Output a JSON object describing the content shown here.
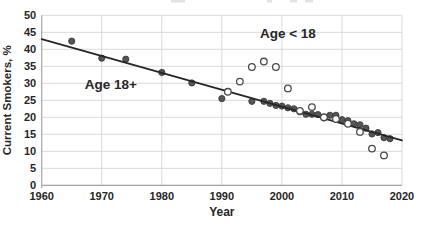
{
  "chart_data": {
    "type": "scatter",
    "title": "",
    "xlabel": "Year",
    "ylabel": "Current Smokers, %",
    "xlim": [
      1960,
      2020
    ],
    "ylim": [
      0,
      50
    ],
    "x_ticks": [
      1960,
      1970,
      1980,
      1990,
      2000,
      2010,
      2020
    ],
    "y_ticks": [
      0,
      5,
      10,
      15,
      20,
      25,
      30,
      35,
      40,
      45,
      50
    ],
    "grid": true,
    "legend_position": "none",
    "series": [
      {
        "name": "Age 18+",
        "marker": "filled-circle",
        "fill": "#555555",
        "stroke": "#3b3b3b",
        "points": [
          [
            1965,
            42.4
          ],
          [
            1970,
            37.4
          ],
          [
            1974,
            37.1
          ],
          [
            1980,
            33.2
          ],
          [
            1985,
            30.1
          ],
          [
            1990,
            25.5
          ],
          [
            1995,
            24.7
          ],
          [
            1997,
            24.7
          ],
          [
            1998,
            24.1
          ],
          [
            1999,
            23.5
          ],
          [
            2000,
            23.3
          ],
          [
            2001,
            22.8
          ],
          [
            2002,
            22.5
          ],
          [
            2003,
            21.6
          ],
          [
            2004,
            20.9
          ],
          [
            2005,
            20.9
          ],
          [
            2006,
            20.8
          ],
          [
            2007,
            19.8
          ],
          [
            2008,
            20.6
          ],
          [
            2009,
            20.6
          ],
          [
            2010,
            19.3
          ],
          [
            2011,
            19.0
          ],
          [
            2012,
            18.1
          ],
          [
            2013,
            17.8
          ],
          [
            2014,
            16.8
          ],
          [
            2015,
            15.1
          ],
          [
            2016,
            15.5
          ],
          [
            2017,
            14.0
          ],
          [
            2018,
            13.7
          ]
        ]
      },
      {
        "name": "Age < 18",
        "marker": "open-circle",
        "fill": "#ffffff",
        "stroke": "#4a4a4a",
        "points": [
          [
            1991,
            27.5
          ],
          [
            1993,
            30.5
          ],
          [
            1995,
            34.8
          ],
          [
            1997,
            36.4
          ],
          [
            1999,
            34.8
          ],
          [
            2001,
            28.5
          ],
          [
            2003,
            21.9
          ],
          [
            2005,
            23.0
          ],
          [
            2007,
            20.0
          ],
          [
            2009,
            19.5
          ],
          [
            2011,
            18.1
          ],
          [
            2013,
            15.7
          ],
          [
            2015,
            10.8
          ],
          [
            2017,
            8.8
          ]
        ]
      }
    ],
    "trendline": {
      "x_start": 1960,
      "y_start": 43.0,
      "x_end": 2020,
      "y_end": 13.2
    },
    "annotations": [
      {
        "text": "Age 18+",
        "x": 1971.5,
        "y": 29.7
      },
      {
        "text": "Age < 18",
        "x": 2001.0,
        "y": 44.6
      }
    ]
  },
  "colors": {
    "background": "#ffffff",
    "gridline": "#d9d9d9",
    "axis_line": "#a6a6a6",
    "trendline": "#262626",
    "text": "#262626"
  }
}
